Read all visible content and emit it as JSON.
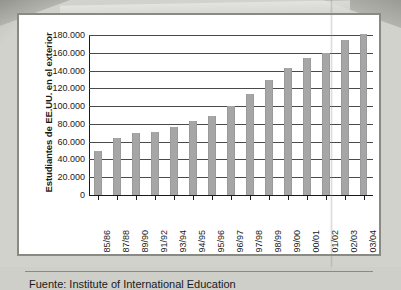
{
  "chart_data": {
    "type": "bar",
    "title": "",
    "subtitle": "",
    "xlabel": "",
    "ylabel": "Estudiantes de EE.UU. en el exterior",
    "ylim": [
      0,
      180000
    ],
    "ytick_values": [
      0,
      20000,
      40000,
      60000,
      80000,
      100000,
      120000,
      140000,
      160000,
      180000
    ],
    "ytick_labels": [
      "0",
      "20.000",
      "40.000",
      "60.000",
      "80.000",
      "100.000",
      "120.000",
      "140.000",
      "160.000",
      "180.000"
    ],
    "grid": true,
    "legend": "none",
    "bar_color": "#a6a6a6",
    "categories": [
      "85/86",
      "87/88",
      "89/90",
      "91/92",
      "93/94",
      "94/95",
      "95/96",
      "96/97",
      "97/98",
      "98/99",
      "99/00",
      "00/01",
      "01/02",
      "02/03",
      "03/04"
    ],
    "values": [
      50000,
      64000,
      70000,
      71000,
      76000,
      83000,
      89000,
      100000,
      114000,
      129000,
      143000,
      154000,
      160000,
      174000,
      181000
    ],
    "source": "Fuente: Institute of International Education"
  },
  "footer": {
    "source_label": "Fuente: Institute of International Education"
  }
}
